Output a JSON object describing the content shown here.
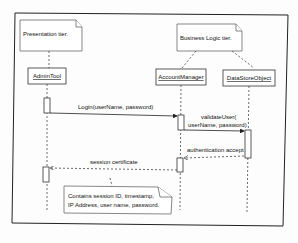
{
  "diagram": {
    "type": "uml-sequence",
    "notes": {
      "presentation_tier": "Presentation tier.",
      "business_tier": "Business Logic tier.",
      "session_note_line1": "Contains session ID, timestamp,",
      "session_note_line2": "IP Address, user name, password."
    },
    "lifelines": {
      "admin_tool": "AdminTool",
      "account_manager": "AccountManager",
      "data_store_object": "DataStoreObject"
    },
    "messages": {
      "login": "Login(userName, password)",
      "validate_line1": "validateUser(",
      "validate_line2": "userName, password)",
      "auth_accept": "authentication accept",
      "session_cert": "session certificate"
    }
  }
}
